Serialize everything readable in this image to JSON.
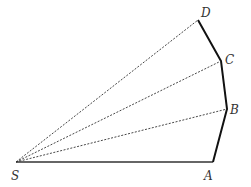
{
  "diagram": {
    "points": {
      "S": {
        "label": "S",
        "x": 16,
        "y": 162,
        "lx": 11,
        "ly": 180
      },
      "A": {
        "label": "A",
        "x": 213,
        "y": 162,
        "lx": 204,
        "ly": 180
      },
      "B": {
        "label": "B",
        "x": 227,
        "y": 109,
        "lx": 230,
        "ly": 114
      },
      "C": {
        "label": "C",
        "x": 221,
        "y": 61,
        "lx": 225,
        "ly": 63
      },
      "D": {
        "label": "D",
        "x": 198,
        "y": 20,
        "lx": 201,
        "ly": 18
      }
    },
    "solid_segments": [
      [
        "S",
        "A"
      ],
      [
        "A",
        "B"
      ],
      [
        "B",
        "C"
      ],
      [
        "C",
        "D"
      ]
    ],
    "dashed_segments": [
      [
        "S",
        "B"
      ],
      [
        "S",
        "C"
      ],
      [
        "S",
        "D"
      ]
    ],
    "colors": {
      "line": "#222222",
      "label": "#333333"
    }
  }
}
